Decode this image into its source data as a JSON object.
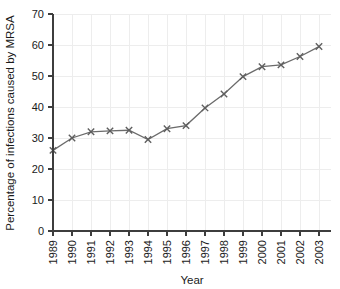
{
  "chart_data": {
    "type": "line",
    "title": "",
    "xlabel": "Year",
    "ylabel": "Percentage of infections caused by MRSA",
    "categories": [
      "1989",
      "1990",
      "1991",
      "1992",
      "1993",
      "1994",
      "1995",
      "1996",
      "1997",
      "1998",
      "1999",
      "2000",
      "2001",
      "2002",
      "2003"
    ],
    "values": [
      26,
      30,
      32,
      32.3,
      32.5,
      29.5,
      33,
      34,
      39.7,
      44.2,
      49.8,
      53,
      53.6,
      56.3,
      59.5
    ],
    "series": [
      {
        "name": "Percentage of infections caused by MRSA",
        "values": [
          26,
          30,
          32,
          32.3,
          32.5,
          29.5,
          33,
          34,
          39.7,
          44.2,
          49.8,
          53,
          53.6,
          56.3,
          59.5
        ]
      }
    ],
    "x": [
      1989,
      1990,
      1991,
      1992,
      1993,
      1994,
      1995,
      1996,
      1997,
      1998,
      1999,
      2000,
      2001,
      2002,
      2003
    ],
    "ylim": [
      0,
      70
    ],
    "xlim": [
      1989,
      2003
    ],
    "yticks": [
      0,
      10,
      20,
      30,
      40,
      50,
      60,
      70
    ],
    "ytick_labels": [
      "0",
      "10",
      "20",
      "30",
      "40",
      "50",
      "60",
      "70"
    ],
    "xtick_labels": [
      "1989",
      "1990",
      "1991",
      "1992",
      "1993",
      "1994",
      "1995",
      "1996",
      "1997",
      "1998",
      "1999",
      "2000",
      "2001",
      "2002",
      "2003"
    ],
    "grid": true,
    "grid_axis": "both",
    "legend": false,
    "legend_position": "none",
    "marker": "x",
    "line_color": "#6b6b6b",
    "marker_color": "#5e5e5e",
    "grid_color": "#ededed",
    "axis_color": "#3d3d3d",
    "background_color": "#ffffff",
    "xtick_rotation": 90
  }
}
